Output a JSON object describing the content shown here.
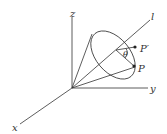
{
  "diagram": {
    "labels": {
      "z": "z",
      "y": "y",
      "x": "x",
      "l": "l",
      "theta": "θ",
      "p_prime": "P′",
      "p": "P"
    },
    "stroke_color": "#333333"
  }
}
